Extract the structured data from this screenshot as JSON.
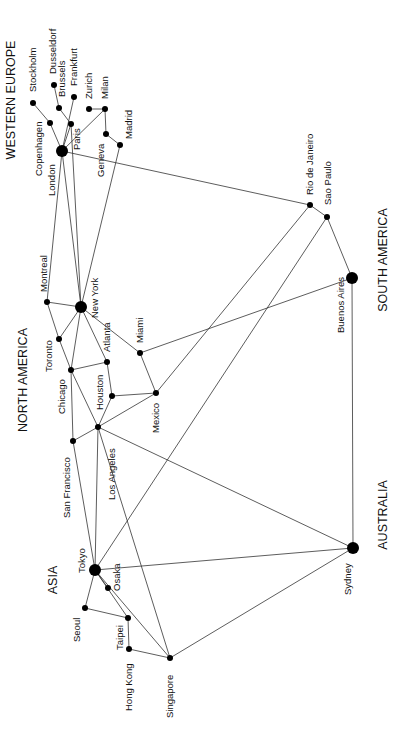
{
  "regions": [
    {
      "id": "western_europe",
      "label": "WESTERN EUROPE",
      "x": 15,
      "y": 100
    },
    {
      "id": "north_america",
      "label": "NORTH AMERICA",
      "x": 27,
      "y": 380
    },
    {
      "id": "asia",
      "label": "ASIA",
      "x": 57,
      "y": 580
    },
    {
      "id": "south_america",
      "label": "SOUTH AMERICA",
      "x": 387,
      "y": 260
    },
    {
      "id": "australia",
      "label": "AUSTRALIA",
      "x": 387,
      "y": 515
    }
  ],
  "nodes": [
    {
      "id": "london",
      "label": "London",
      "x": 62,
      "y": 151,
      "r": 6,
      "lx": 55,
      "ly": 196
    },
    {
      "id": "copenhagen",
      "label": "Copenhagen",
      "x": 50,
      "y": 123,
      "r": 3,
      "lx": 42,
      "ly": 176
    },
    {
      "id": "stockholm",
      "label": "Stockholm",
      "x": 33,
      "y": 103,
      "r": 3,
      "lx": 36,
      "ly": 92
    },
    {
      "id": "brussels",
      "label": "Brussels",
      "x": 59,
      "y": 108,
      "r": 3,
      "lx": 65,
      "ly": 97
    },
    {
      "id": "dusseldorf",
      "label": "Dusseldorf",
      "x": 54,
      "y": 85,
      "r": 3,
      "lx": 56,
      "ly": 74
    },
    {
      "id": "paris",
      "label": "Paris",
      "x": 71,
      "y": 124,
      "r": 3,
      "lx": 80,
      "ly": 150
    },
    {
      "id": "frankfurt",
      "label": "Frankfurt",
      "x": 74,
      "y": 97,
      "r": 3,
      "lx": 77,
      "ly": 86
    },
    {
      "id": "zurich",
      "label": "Zurich",
      "x": 89,
      "y": 109,
      "r": 3,
      "lx": 92,
      "ly": 99
    },
    {
      "id": "milan",
      "label": "Milan",
      "x": 105,
      "y": 109,
      "r": 3,
      "lx": 108,
      "ly": 99
    },
    {
      "id": "geneva",
      "label": "Geneva",
      "x": 106,
      "y": 134,
      "r": 3,
      "lx": 104,
      "ly": 177
    },
    {
      "id": "madrid",
      "label": "Madrid",
      "x": 120,
      "y": 145,
      "r": 3,
      "lx": 132,
      "ly": 139
    },
    {
      "id": "montreal",
      "label": "Montreal",
      "x": 47,
      "y": 302,
      "r": 3,
      "lx": 47,
      "ly": 292
    },
    {
      "id": "new_york",
      "label": "New York",
      "x": 81,
      "y": 307,
      "r": 6,
      "lx": 98,
      "ly": 318
    },
    {
      "id": "toronto",
      "label": "Toronto",
      "x": 59,
      "y": 339,
      "r": 3,
      "lx": 52,
      "ly": 372
    },
    {
      "id": "chicago",
      "label": "Chicago",
      "x": 71,
      "y": 370,
      "r": 3,
      "lx": 65,
      "ly": 414
    },
    {
      "id": "atlanta",
      "label": "Atlanta",
      "x": 107,
      "y": 362,
      "r": 3,
      "lx": 110,
      "ly": 352
    },
    {
      "id": "miami",
      "label": "Miami",
      "x": 140,
      "y": 353,
      "r": 3,
      "lx": 143,
      "ly": 343
    },
    {
      "id": "houston",
      "label": "Houston",
      "x": 112,
      "y": 396,
      "r": 3,
      "lx": 103,
      "ly": 410
    },
    {
      "id": "mexico",
      "label": "Mexico",
      "x": 156,
      "y": 393,
      "r": 3,
      "lx": 159,
      "ly": 433
    },
    {
      "id": "los_angeles",
      "label": "Los Angeles",
      "x": 98,
      "y": 427,
      "r": 3,
      "lx": 115,
      "ly": 500
    },
    {
      "id": "san_francisco",
      "label": "San Francisco",
      "x": 73,
      "y": 441,
      "r": 3,
      "lx": 70,
      "ly": 518
    },
    {
      "id": "tokyo",
      "label": "Tokyo",
      "x": 95,
      "y": 570,
      "r": 6,
      "lx": 85,
      "ly": 573
    },
    {
      "id": "osaka",
      "label": "Osaka",
      "x": 108,
      "y": 588,
      "r": 3,
      "lx": 120,
      "ly": 591
    },
    {
      "id": "seoul",
      "label": "Seoul",
      "x": 85,
      "y": 608,
      "r": 3,
      "lx": 80,
      "ly": 642
    },
    {
      "id": "taipei",
      "label": "Taipei",
      "x": 128,
      "y": 618,
      "r": 3,
      "lx": 123,
      "ly": 650
    },
    {
      "id": "hong_kong",
      "label": "Hong Kong",
      "x": 129,
      "y": 649,
      "r": 3,
      "lx": 132,
      "ly": 711
    },
    {
      "id": "singapore",
      "label": "Singapore",
      "x": 170,
      "y": 658,
      "r": 3,
      "lx": 173,
      "ly": 718
    },
    {
      "id": "rio_de_janeiro",
      "label": "Rio de Janeiro",
      "x": 310,
      "y": 205,
      "r": 3,
      "lx": 313,
      "ly": 195
    },
    {
      "id": "sao_paulo",
      "label": "Sao Paulo",
      "x": 327,
      "y": 217,
      "r": 3,
      "lx": 331,
      "ly": 205
    },
    {
      "id": "buenos_aires",
      "label": "Buenos Aires",
      "x": 352,
      "y": 278,
      "r": 6,
      "lx": 344,
      "ly": 333
    },
    {
      "id": "sydney",
      "label": "Sydney",
      "x": 353,
      "y": 548,
      "r": 6,
      "lx": 351,
      "ly": 595
    }
  ],
  "edges": [
    [
      "london",
      "copenhagen"
    ],
    [
      "copenhagen",
      "stockholm"
    ],
    [
      "london",
      "paris"
    ],
    [
      "paris",
      "brussels"
    ],
    [
      "brussels",
      "dusseldorf"
    ],
    [
      "london",
      "frankfurt"
    ],
    [
      "zurich",
      "milan"
    ],
    [
      "milan",
      "geneva"
    ],
    [
      "geneva",
      "madrid"
    ],
    [
      "milan",
      "london"
    ],
    [
      "london",
      "rio_de_janeiro"
    ],
    [
      "madrid",
      "new_york"
    ],
    [
      "london",
      "montreal"
    ],
    [
      "london",
      "new_york"
    ],
    [
      "paris",
      "new_york"
    ],
    [
      "montreal",
      "new_york"
    ],
    [
      "montreal",
      "toronto"
    ],
    [
      "toronto",
      "chicago"
    ],
    [
      "toronto",
      "new_york"
    ],
    [
      "new_york",
      "chicago"
    ],
    [
      "new_york",
      "atlanta"
    ],
    [
      "new_york",
      "miami"
    ],
    [
      "chicago",
      "atlanta"
    ],
    [
      "chicago",
      "san_francisco"
    ],
    [
      "chicago",
      "los_angeles"
    ],
    [
      "atlanta",
      "houston"
    ],
    [
      "houston",
      "mexico"
    ],
    [
      "houston",
      "los_angeles"
    ],
    [
      "miami",
      "mexico"
    ],
    [
      "miami",
      "buenos_aires"
    ],
    [
      "mexico",
      "los_angeles"
    ],
    [
      "mexico",
      "rio_de_janeiro"
    ],
    [
      "los_angeles",
      "san_francisco"
    ],
    [
      "los_angeles",
      "tokyo"
    ],
    [
      "los_angeles",
      "sydney"
    ],
    [
      "los_angeles",
      "singapore"
    ],
    [
      "san_francisco",
      "tokyo"
    ],
    [
      "tokyo",
      "sao_paulo"
    ],
    [
      "tokyo",
      "sydney"
    ],
    [
      "tokyo",
      "seoul"
    ],
    [
      "tokyo",
      "osaka"
    ],
    [
      "tokyo",
      "taipei"
    ],
    [
      "tokyo",
      "singapore"
    ],
    [
      "seoul",
      "taipei"
    ],
    [
      "taipei",
      "hong_kong"
    ],
    [
      "hong_kong",
      "singapore"
    ],
    [
      "singapore",
      "sydney"
    ],
    [
      "rio_de_janeiro",
      "sao_paulo"
    ],
    [
      "sao_paulo",
      "buenos_aires"
    ],
    [
      "buenos_aires",
      "sydney"
    ]
  ]
}
